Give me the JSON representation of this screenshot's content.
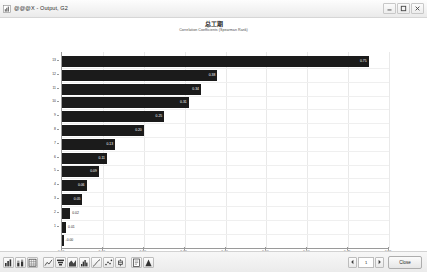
{
  "window": {
    "title": "@@@X - Output, G2",
    "icon": "chart-window-icon",
    "controls": {
      "minimize_label": "–",
      "maximize_label": "□",
      "close_label": "×"
    }
  },
  "chart_data": {
    "type": "bar",
    "orientation": "horizontal",
    "title": "总工期",
    "subtitle": "Correlation Coefficients (Spearman Rank)",
    "xlabel": "Coefficient Value",
    "ylabel": "",
    "xlim": [
      0.0,
      0.8
    ],
    "xticks": [
      "0.00",
      "0.10",
      "0.20",
      "0.30",
      "0.40",
      "0.50",
      "0.60",
      "0.70",
      "0.80"
    ],
    "grid": true,
    "legend": "none",
    "categories": [
      "13",
      "12",
      "11",
      "10",
      "9",
      "8",
      "7",
      "6",
      "5",
      "4",
      "3",
      "2",
      "1"
    ],
    "values": [
      0.75,
      0.38,
      0.34,
      0.31,
      0.25,
      0.2,
      0.13,
      0.11,
      0.09,
      0.06,
      0.05,
      0.02,
      0.01
    ],
    "value_labels": [
      "0.75",
      "0.38",
      "0.34",
      "0.31",
      "0.25",
      "0.20",
      "0.13",
      "0.11",
      "0.09",
      "0.06",
      "0.05",
      "0.02",
      "0.01"
    ],
    "negative_marker": {
      "label": "-0.00",
      "present": true
    }
  },
  "toolbar": {
    "items": [
      {
        "name": "bar-chart-icon",
        "tip": "Bar Chart"
      },
      {
        "name": "stacked-bar-icon",
        "tip": "Stacked Bar"
      },
      {
        "name": "grid-table-icon",
        "tip": "Data Table"
      },
      {
        "name": "line-chart-icon",
        "tip": "Line Chart"
      },
      {
        "name": "tornado-chart-icon",
        "tip": "Tornado Chart"
      },
      {
        "name": "area-chart-icon",
        "tip": "Area Chart"
      },
      {
        "name": "histogram-icon",
        "tip": "Histogram"
      },
      {
        "name": "cumulative-curve-icon",
        "tip": "Cumulative Curve"
      },
      {
        "name": "scatter-plot-icon",
        "tip": "Scatter Plot"
      },
      {
        "name": "box-plot-icon",
        "tip": "Box Plot"
      },
      {
        "name": "text-report-icon",
        "tip": "Text Report"
      },
      {
        "name": "summary-icon",
        "tip": "Summary"
      }
    ]
  },
  "footer": {
    "prev_label": "◄",
    "page_value": "1",
    "next_label": "►",
    "close_label": "Close"
  }
}
